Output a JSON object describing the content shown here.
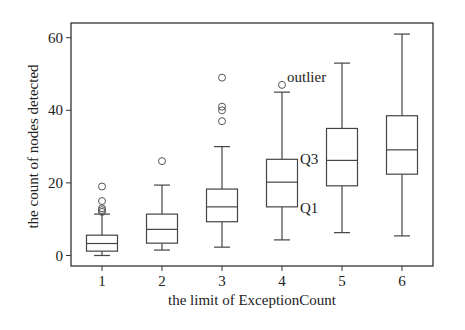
{
  "chart_data": {
    "type": "box",
    "title": "",
    "xlabel": "the limit of ExceptionCount",
    "ylabel": "the count of nodes detected",
    "categories": [
      "1",
      "2",
      "3",
      "4",
      "5",
      "6"
    ],
    "yticks": [
      0,
      20,
      40,
      60
    ],
    "ylim": [
      -3,
      64
    ],
    "grid": false,
    "legend": null,
    "boxes": [
      {
        "category": "1",
        "whisker_low": 0,
        "q1": 1.2,
        "median": 3.3,
        "q3": 5.6,
        "whisker_high": 11.4,
        "outliers": [
          12,
          12.5,
          13,
          15,
          19
        ]
      },
      {
        "category": "2",
        "whisker_low": 1.5,
        "q1": 3.4,
        "median": 7.2,
        "q3": 11.4,
        "whisker_high": 19.4,
        "outliers": [
          26
        ]
      },
      {
        "category": "3",
        "whisker_low": 2.3,
        "q1": 9.3,
        "median": 13.4,
        "q3": 18.3,
        "whisker_high": 30,
        "outliers": [
          37,
          40,
          41,
          49
        ]
      },
      {
        "category": "4",
        "whisker_low": 4.3,
        "q1": 13.4,
        "median": 20.2,
        "q3": 26.5,
        "whisker_high": 45,
        "outliers": [
          47
        ]
      },
      {
        "category": "5",
        "whisker_low": 6.3,
        "q1": 19.2,
        "median": 26.2,
        "q3": 35,
        "whisker_high": 53,
        "outliers": []
      },
      {
        "category": "6",
        "whisker_low": 5.4,
        "q1": 22.4,
        "median": 29.1,
        "q3": 38.5,
        "whisker_high": 61,
        "outliers": []
      }
    ],
    "annotations": [
      {
        "text": "outlier",
        "target": "category 4 outlier",
        "x": 287,
        "y": 82
      },
      {
        "text": "Q3",
        "target": "category 4 upper quartile",
        "x": 300,
        "y": 164
      },
      {
        "text": "Q1",
        "target": "category 4 lower quartile",
        "x": 300,
        "y": 213
      }
    ]
  },
  "layout": {
    "width": 465,
    "height": 330,
    "plot": {
      "left": 71,
      "top": 23,
      "right": 433,
      "bottom": 266
    },
    "y_zero_px": 255.5,
    "px_per_unit": 3.63,
    "first_cat_x": 102,
    "cat_spacing": 60,
    "box_width": 31,
    "cap_width": 16,
    "outlier_radius": 3.5
  }
}
